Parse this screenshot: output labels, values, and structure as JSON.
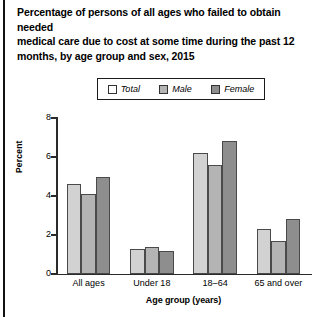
{
  "chart_data": {
    "type": "bar",
    "title": "Percentage of persons of all ages who failed to obtain needed medical care due to cost at some time during the past 12 months, by age group and sex, 2015",
    "xlabel": "Age group (years)",
    "ylabel": "Percent",
    "categories": [
      "All ages",
      "Under 18",
      "18–64",
      "65 and over"
    ],
    "series": [
      {
        "name": "Total",
        "values": [
          4.6,
          1.3,
          6.2,
          2.3
        ],
        "color": "#d2d2d2"
      },
      {
        "name": "Male",
        "values": [
          4.1,
          1.4,
          5.6,
          1.7
        ],
        "color": "#b4b4b4"
      },
      {
        "name": "Female",
        "values": [
          5.0,
          1.2,
          6.8,
          2.8
        ],
        "color": "#8e8e8e"
      }
    ],
    "ylim": [
      0,
      8
    ],
    "yticks": [
      0,
      2,
      4,
      6,
      8
    ],
    "ytick_labels": [
      "0",
      "2",
      "4",
      "6",
      "8"
    ],
    "grid": false,
    "legend_position": "top-center"
  },
  "title": {
    "text": "Percentage of persons of all ages who failed to obtain needed\nmedical care due to cost at some time during the past 12\nmonths, by age group and sex, 2015"
  },
  "legend": {
    "entries": [
      {
        "label": "Total",
        "swatch": "#ffffff"
      },
      {
        "label": "Male",
        "swatch": "#b4b4b4"
      },
      {
        "label": "Female",
        "swatch": "#8e8e8e"
      }
    ]
  },
  "axes": {
    "y_title": "Percent",
    "x_title": "Age group (years)",
    "y_tick_labels": [
      "8",
      "6",
      "4",
      "2",
      "0"
    ],
    "x_group_labels": [
      "All ages",
      "Under 18",
      "18–64",
      "65 and over"
    ]
  }
}
